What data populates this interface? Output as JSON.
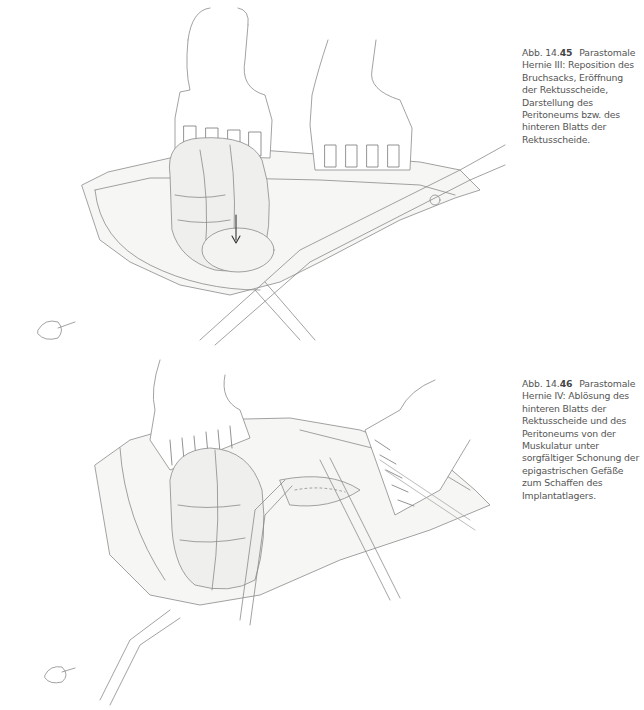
{
  "figures": [
    {
      "label_prefix": "Abb. 14.",
      "label_number": "45",
      "caption": "Parastomale Hernie III: Reposition des Bruchsacks, Eröffnung der Rektusscheide, Darstellung des Peritoneums bzw. des hinteren Blatts der Rektusscheide.",
      "illustration": "surgical-drawing-retractors-bowel-scissors"
    },
    {
      "label_prefix": "Abb. 14.",
      "label_number": "46",
      "caption": "Parastomale Hernie IV: Ablösung des hinteren Blatts der Rektusscheide und des Peritoneums von der Muskulatur unter sorgfältiger Schonung der epigastrischen Gefäße zum Schaffen des Implantatlagers.",
      "illustration": "surgical-drawing-retractors-bowel-forceps"
    }
  ]
}
